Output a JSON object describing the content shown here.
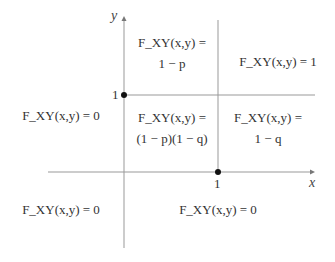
{
  "diagram": {
    "type": "piecewise CDF regions",
    "axes": {
      "x_label": "x",
      "y_label": "y"
    },
    "ticks": {
      "x_one": "1",
      "y_one": "1"
    },
    "points": [
      {
        "x": 0,
        "y": 1,
        "label": "(0,1)"
      },
      {
        "x": 1,
        "y": 0,
        "label": "(1,0)"
      }
    ],
    "regions": {
      "top_middle": {
        "line1": "F_XY(x,y) =",
        "line2": "1 − p"
      },
      "top_right": {
        "line1": "F_XY(x,y) = 1"
      },
      "left_middle": {
        "line1": "F_XY(x,y) = 0"
      },
      "center": {
        "line1": "F_XY(x,y) =",
        "line2": "(1 − p)(1 − q)"
      },
      "center_right": {
        "line1": "F_XY(x,y) =",
        "line2": "1 − q"
      },
      "bottom_left": {
        "line1": "F_XY(x,y) = 0"
      },
      "bottom_right": {
        "line1": "F_XY(x,y) = 0"
      }
    },
    "colors": {
      "line": "#888888",
      "dot": "#111111",
      "text": "#333333"
    }
  }
}
